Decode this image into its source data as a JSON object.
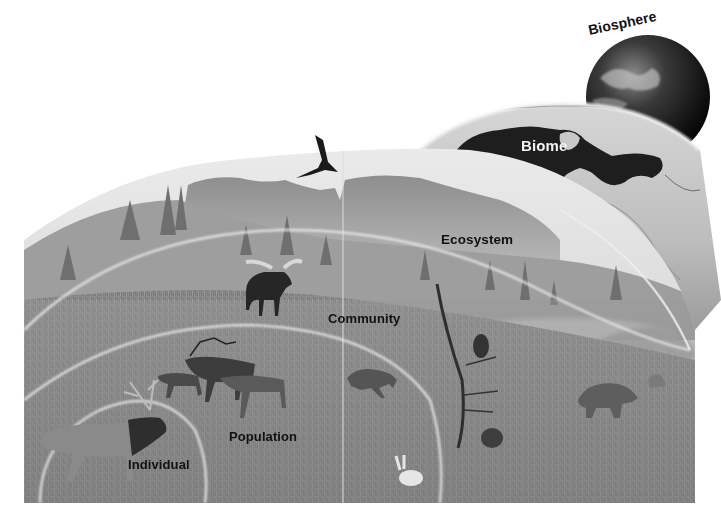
{
  "figure": {
    "style": "grayscale illustration",
    "levels": [
      {
        "id": "individual",
        "label": "Individual",
        "depicts": "single bull elk"
      },
      {
        "id": "population",
        "label": "Population",
        "depicts": "group of elk"
      },
      {
        "id": "community",
        "label": "Community",
        "depicts": "moose, lynx, owl, beaver, hare, bear in forest meadow"
      },
      {
        "id": "ecosystem",
        "label": "Ecosystem",
        "depicts": "forest, meadow, mountains and sky"
      },
      {
        "id": "biome",
        "label": "Biome",
        "depicts": "map of North America with boreal forest biome shaded dark"
      },
      {
        "id": "biosphere",
        "label": "Biosphere",
        "depicts": "planet Earth"
      }
    ],
    "colors": {
      "background": "#ffffff",
      "label_text": "#111111",
      "biome_label_text": "#f2f2f2",
      "biome_region": "#1e1e1e",
      "globe_dark": "#151515",
      "scene_mid_gray": "#9a9a9a",
      "ring_highlight": "#e8e8e8"
    }
  }
}
